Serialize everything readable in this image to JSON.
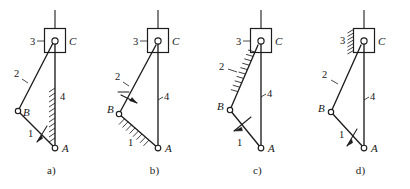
{
  "figure": {
    "background_color": "#ffffff",
    "ink_color": "#1d1d1d",
    "panels": [
      {
        "caption": "a)",
        "fixed_link_description": "link 4 hatched (vertical guide A-C grounded)",
        "driver_marker_on": "1",
        "joint_labels": {
          "A": "A",
          "B": "B",
          "C": "C"
        },
        "link_labels": {
          "one": "1",
          "two": "2",
          "three": "3",
          "four": "4"
        }
      },
      {
        "caption": "b)",
        "fixed_link_description": "link 1 hatched (B-A grounded)",
        "driver_marker_on": "2",
        "joint_labels": {
          "A": "A",
          "B": "B",
          "C": "C"
        },
        "link_labels": {
          "one": "1",
          "two": "2",
          "three": "3",
          "four": "4"
        }
      },
      {
        "caption": "c)",
        "fixed_link_description": "link 2 hatched (B-C grounded)",
        "driver_marker_on": "1",
        "joint_labels": {
          "A": "A",
          "B": "B",
          "C": "C"
        },
        "link_labels": {
          "one": "1",
          "two": "2",
          "three": "3",
          "four": "4"
        }
      },
      {
        "caption": "d)",
        "fixed_link_description": "link 3 hatched (slider block at C grounded)",
        "driver_marker_on": "1",
        "joint_labels": {
          "A": "A",
          "B": "B",
          "C": "C"
        },
        "link_labels": {
          "one": "1",
          "two": "2",
          "three": "3",
          "four": "4"
        }
      }
    ]
  }
}
